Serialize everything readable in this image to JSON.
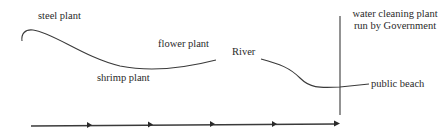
{
  "diagram": {
    "labels": {
      "steel_plant": "steel plant",
      "flower_plant": "flower plant",
      "shrimp_plant": "shrimp plant",
      "river": "River",
      "water_cleaning": "water cleaning plant run by Government",
      "public_beach": "public beach"
    },
    "flow_arrow": {
      "arrowhead_count": 5,
      "direction": "left-to-right"
    },
    "colors": {
      "line": "#3a3a3a",
      "text": "#2a2a2a",
      "background": "#ffffff"
    }
  }
}
